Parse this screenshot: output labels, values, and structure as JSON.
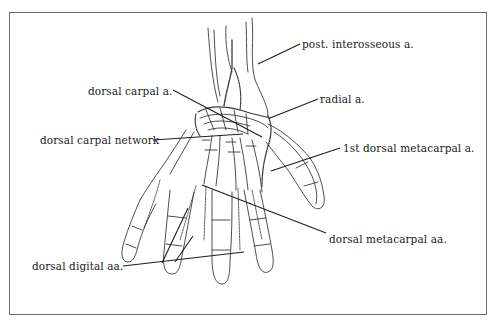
{
  "figure": {
    "frame": {
      "x": 9,
      "y": 12,
      "width": 478,
      "height": 303,
      "border_color": "#6a6a6a"
    },
    "line_color": "#333333",
    "labels": [
      {
        "id": "post-interosseous",
        "text": "post. interosseous a.",
        "x": 302,
        "y": 39,
        "leader": [
          [
            300,
            44
          ],
          [
            258,
            64
          ]
        ]
      },
      {
        "id": "dorsal-carpal-a",
        "text": "dorsal carpal a.",
        "x": 88,
        "y": 86,
        "leader": [
          [
            173,
            90
          ],
          [
            262,
            137
          ]
        ]
      },
      {
        "id": "radial-a",
        "text": "radial a.",
        "x": 320,
        "y": 94,
        "leader": [
          [
            318,
            99
          ],
          [
            270,
            118
          ]
        ]
      },
      {
        "id": "dorsal-carpal-network",
        "text": "dorsal carpal network",
        "x": 40,
        "y": 135,
        "leader": [
          [
            153,
            140
          ],
          [
            243,
            134
          ]
        ]
      },
      {
        "id": "first-dorsal-metacarpal",
        "text": "1st dorsal metacarpal a.",
        "x": 343,
        "y": 143,
        "leader": [
          [
            340,
            148
          ],
          [
            271,
            171
          ]
        ]
      },
      {
        "id": "dorsal-metacarpal-aa",
        "text": "dorsal metacarpal aa.",
        "x": 329,
        "y": 234,
        "leader": [
          [
            326,
            233
          ],
          [
            202,
            185
          ]
        ]
      },
      {
        "id": "dorsal-digital-aa",
        "text": "dorsal digital aa.",
        "x": 32,
        "y": 261,
        "leader": [
          [
            123,
            266
          ],
          [
            244,
            252
          ]
        ]
      }
    ],
    "extra_leaders": [
      {
        "for": "dorsal-digital-aa",
        "points": [
          [
            162,
            263
          ],
          [
            188,
            208
          ]
        ]
      },
      {
        "for": "dorsal-digital-aa",
        "points": [
          [
            175,
            262
          ],
          [
            193,
            236
          ]
        ]
      }
    ]
  }
}
